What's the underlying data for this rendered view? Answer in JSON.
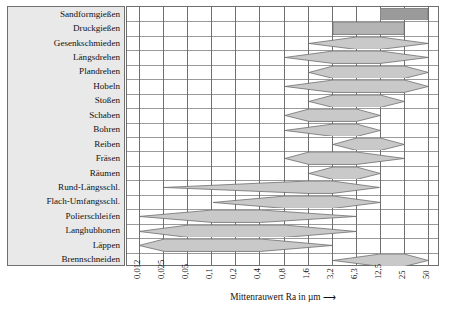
{
  "chart_data": {
    "type": "bar",
    "title": "",
    "xlabel": "Mittenrauwert Ra in µm",
    "ylabel": "",
    "xscale": "log",
    "grid": true,
    "legend": null,
    "tick_labels": [
      "0,012",
      "0,025",
      "0,05",
      "0,1",
      "0,2",
      "0,4",
      "0,8",
      "1,6",
      "3,2",
      "6,3",
      "12,5",
      "25",
      "50"
    ],
    "tick_values": [
      0.012,
      0.025,
      0.05,
      0.1,
      0.2,
      0.4,
      0.8,
      1.6,
      3.2,
      6.3,
      12.5,
      25,
      50
    ],
    "categories": [
      "Sandformgießen",
      "Druckgießen",
      "Gesenkschmieden",
      "Längsdrehen",
      "Plandrehen",
      "Hobeln",
      "Stoßen",
      "Schaben",
      "Bohren",
      "Reiben",
      "Fräsen",
      "Räumen",
      "Rund-Längsschl.",
      "Flach-Umfangsschl.",
      "Polierschleifen",
      "Langhubhonen",
      "Läppen",
      "Brennschneiden"
    ],
    "series": [
      {
        "name": "Sandformgießen",
        "shape": "bar",
        "min": 12.5,
        "max": 50,
        "typ_min": 12.5,
        "typ_max": 50,
        "tone": "dark"
      },
      {
        "name": "Druckgießen",
        "shape": "bar",
        "min": 3.2,
        "max": 25,
        "typ_min": 3.2,
        "typ_max": 25,
        "tone": "mid"
      },
      {
        "name": "Gesenkschmieden",
        "shape": "lens",
        "min": 1.6,
        "max": 50,
        "typ_min": 6.3,
        "typ_max": 12.5,
        "tone": "light"
      },
      {
        "name": "Längsdrehen",
        "shape": "lens",
        "min": 0.8,
        "max": 50,
        "typ_min": 3.2,
        "typ_max": 12.5,
        "tone": "light"
      },
      {
        "name": "Plandrehen",
        "shape": "lens",
        "min": 1.6,
        "max": 50,
        "typ_min": 3.2,
        "typ_max": 25,
        "tone": "light"
      },
      {
        "name": "Hobeln",
        "shape": "lens",
        "min": 0.8,
        "max": 50,
        "typ_min": 3.2,
        "typ_max": 25,
        "tone": "light"
      },
      {
        "name": "Stoßen",
        "shape": "lens",
        "min": 1.6,
        "max": 25,
        "typ_min": 3.2,
        "typ_max": 12.5,
        "tone": "light"
      },
      {
        "name": "Schaben",
        "shape": "lens",
        "min": 0.8,
        "max": 12.5,
        "typ_min": 1.6,
        "typ_max": 6.3,
        "tone": "light"
      },
      {
        "name": "Bohren",
        "shape": "lens",
        "min": 0.8,
        "max": 12.5,
        "typ_min": 3.2,
        "typ_max": 6.3,
        "tone": "light"
      },
      {
        "name": "Reiben",
        "shape": "lens",
        "min": 3.2,
        "max": 25,
        "typ_min": 6.3,
        "typ_max": 12.5,
        "tone": "light"
      },
      {
        "name": "Fräsen",
        "shape": "lens",
        "min": 0.8,
        "max": 25,
        "typ_min": 1.6,
        "typ_max": 6.3,
        "tone": "light"
      },
      {
        "name": "Räumen",
        "shape": "lens",
        "min": 1.6,
        "max": 12.5,
        "typ_min": 3.2,
        "typ_max": 6.3,
        "tone": "light"
      },
      {
        "name": "Rund-Längsschl.",
        "shape": "lens",
        "min": 0.025,
        "max": 12.5,
        "typ_min": 1.6,
        "typ_max": 3.2,
        "tone": "light"
      },
      {
        "name": "Flach-Umfangsschl.",
        "shape": "lens",
        "min": 0.1,
        "max": 12.5,
        "typ_min": 0.8,
        "typ_max": 3.2,
        "tone": "light"
      },
      {
        "name": "Polierschleifen",
        "shape": "lens",
        "min": 0.012,
        "max": 6.3,
        "typ_min": 0.1,
        "typ_max": 0.4,
        "tone": "light"
      },
      {
        "name": "Langhubhonen",
        "shape": "lens",
        "min": 0.012,
        "max": 6.3,
        "typ_min": 0.05,
        "typ_max": 0.8,
        "tone": "light"
      },
      {
        "name": "Läppen",
        "shape": "lens",
        "min": 0.012,
        "max": 3.2,
        "typ_min": 0.025,
        "typ_max": 0.4,
        "tone": "light"
      },
      {
        "name": "Brennschneiden",
        "shape": "lens",
        "min": 3.2,
        "max": 50,
        "typ_min": 12.5,
        "typ_max": 25,
        "tone": "light"
      }
    ]
  },
  "colors": {
    "band_light": "#c9c9c9",
    "band_mid": "#b4b4b4",
    "band_dark": "#9a9a9a",
    "band_stroke": "#6f6f6f",
    "grid_line": "#9a9a9a",
    "frame": "#6f6f6f",
    "panel_bg": "#e9e9e9",
    "text": "#111111"
  },
  "axis": {
    "title_text": "Mittenrauwert Ra in µm",
    "title_arrow": "⟶"
  }
}
